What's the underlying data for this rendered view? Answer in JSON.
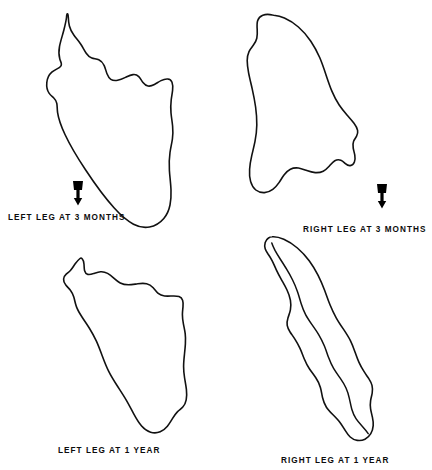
{
  "figure": {
    "kind": "anatomical-outline-tracings",
    "background_color": "#ffffff",
    "stroke_color": "#111111",
    "panel_count": 4
  },
  "panels": [
    {
      "id": "left-leg-3-months",
      "caption": "LEFT LEG AT 3 MONTHS",
      "position": "top-left"
    },
    {
      "id": "right-leg-3-months",
      "caption": "RIGHT LEG AT 3 MONTHS",
      "position": "top-right"
    },
    {
      "id": "left-leg-1-year",
      "caption": "LEFT LEG AT 1 YEAR",
      "position": "bottom-left"
    },
    {
      "id": "right-leg-1-year",
      "caption": "RIGHT LEG AT 1 YEAR",
      "position": "bottom-right"
    }
  ],
  "markers": [
    {
      "id": "marker-left",
      "icon": "down-arrow-icon",
      "direction": "down"
    },
    {
      "id": "marker-right",
      "icon": "down-arrow-icon",
      "direction": "down"
    }
  ]
}
